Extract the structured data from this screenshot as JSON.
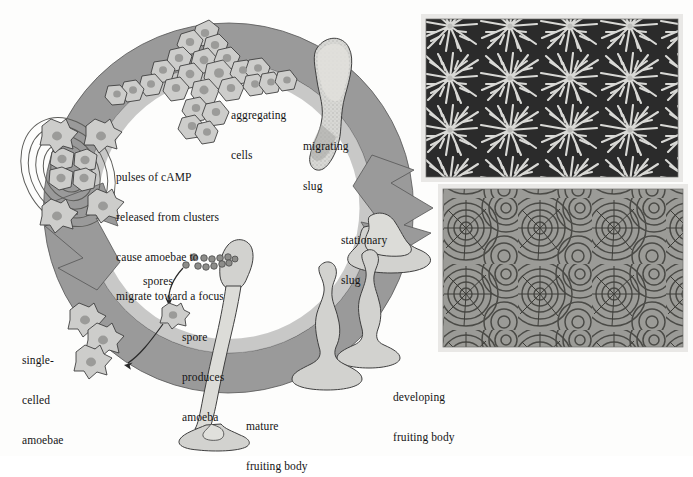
{
  "figure": {
    "background_color": "#fdfdfc",
    "cycle_ring_color": "#9a9a9a",
    "cycle_ring_inner_color": "#b4b4b4",
    "organism_fill": "#cdcdcb",
    "outline_color": "#3a3a3a",
    "text_color": "#141414"
  },
  "labels": {
    "aggregating_cells": "aggregating\ncells",
    "migrating_slug": "migrating\nslug",
    "stationary_slug": "stationary\nslug",
    "developing_fruiting_body": "developing\nfruiting body",
    "mature_fruiting_body": "mature\nfruiting body",
    "spores": "spores",
    "spore_produces_amoeba": "spore\nproduces\namoeba",
    "single_celled_amoebae": "single-\ncelled\namoebae",
    "camp_pulses": "pulses of cAMP\nreleased from clusters\ncause amoebae to\nmigrate toward a focus"
  },
  "label_lines": {
    "aggregating_cells": [
      "aggregating",
      "cells"
    ],
    "migrating_slug": [
      "migrating",
      "slug"
    ],
    "stationary_slug": [
      "stationary",
      "slug"
    ],
    "developing_fruiting_body": [
      "developing",
      "fruiting body"
    ],
    "mature_fruiting_body": [
      "mature",
      "fruiting body"
    ],
    "spores": [
      "spores"
    ],
    "spore_produces_amoeba": [
      "spore",
      "produces",
      "amoeba"
    ],
    "single_celled_amoebae": [
      "single-",
      "celled",
      "amoebae"
    ],
    "camp_pulses": [
      "pulses of cAMP",
      "released from clusters",
      "cause amoebae to",
      "migrate toward a focus"
    ]
  },
  "micrographs": [
    {
      "name": "aggregation-streams-micrograph",
      "description": "dark-field micrograph of bright branching aggregation streams of amoebae converging on centres",
      "tone": "dark background with light branching streams"
    },
    {
      "name": "camp-spiral-waves-micrograph",
      "description": "micrograph of concentric and spiral cAMP signalling waves radiating from aggregation centres",
      "tone": "mid grey with dark concentric banding"
    }
  ],
  "stages": [
    "single-celled amoebae",
    "pulses of cAMP released from clusters",
    "aggregating cells",
    "migrating slug",
    "stationary slug",
    "developing fruiting body",
    "mature fruiting body",
    "spores",
    "spore produces amoeba"
  ]
}
